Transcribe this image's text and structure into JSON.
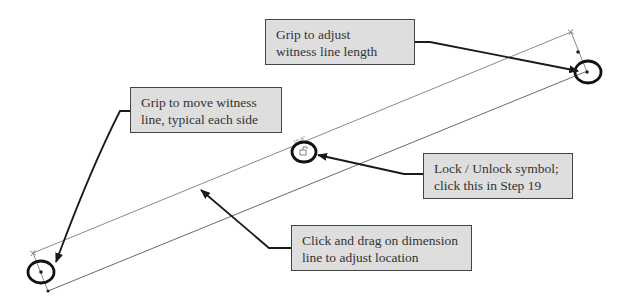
{
  "diagram": {
    "type": "annotated dimension grips",
    "colors": {
      "callout_fill": "#dedede",
      "callout_border": "#444444",
      "arrow": "#1a1a1a",
      "geometry_line": "#888888",
      "grip_circle": "#111111"
    },
    "callouts": [
      {
        "id": "witness-length",
        "line1": "Grip to adjust",
        "line2": "witness line length"
      },
      {
        "id": "move-witness",
        "line1": "Grip to move witness",
        "line2": "line, typical each side"
      },
      {
        "id": "lock-unlock",
        "line1": "Lock / Unlock symbol;",
        "line2": "click this in Step 19"
      },
      {
        "id": "drag-dimension",
        "line1": "Click and drag on dimension",
        "line2": "line to adjust location"
      }
    ],
    "dimension_text": "15'-6\""
  }
}
